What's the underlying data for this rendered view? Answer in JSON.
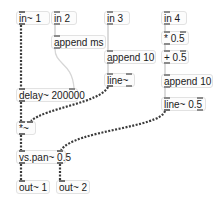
{
  "patcher": {
    "objects": [
      {
        "id": "in1",
        "text": "in~ 1"
      },
      {
        "id": "in2",
        "text": "in 2"
      },
      {
        "id": "in3",
        "text": "in 3"
      },
      {
        "id": "in4",
        "text": "in 4"
      },
      {
        "id": "append_ms",
        "text": "append ms"
      },
      {
        "id": "times_half",
        "text": "* 0.5"
      },
      {
        "id": "append10a",
        "text": "append 10"
      },
      {
        "id": "plus_half",
        "text": "+ 0.5"
      },
      {
        "id": "delay",
        "text": "delay~ 200000"
      },
      {
        "id": "line_a",
        "text": "line~"
      },
      {
        "id": "append10b",
        "text": "append 10"
      },
      {
        "id": "line_b",
        "text": "line~ 0.5"
      },
      {
        "id": "mult",
        "text": "*~"
      },
      {
        "id": "vspan",
        "text": "vs.pan~ 0.5"
      },
      {
        "id": "out1",
        "text": "out~ 1"
      },
      {
        "id": "out2",
        "text": "out~ 2"
      }
    ],
    "cords": [
      {
        "from": "in1",
        "to": "delay",
        "type": "signal"
      },
      {
        "from": "in2",
        "to": "append_ms",
        "type": "message"
      },
      {
        "from": "append_ms",
        "to": "delay",
        "type": "message"
      },
      {
        "from": "in3",
        "to": "append10a",
        "type": "message"
      },
      {
        "from": "append10a",
        "to": "line_a",
        "type": "message"
      },
      {
        "from": "in4",
        "to": "times_half",
        "type": "message"
      },
      {
        "from": "times_half",
        "to": "plus_half",
        "type": "message"
      },
      {
        "from": "plus_half",
        "to": "append10b",
        "type": "message"
      },
      {
        "from": "append10b",
        "to": "line_b",
        "type": "message"
      },
      {
        "from": "delay",
        "to": "mult",
        "type": "signal"
      },
      {
        "from": "line_a",
        "to": "mult",
        "type": "signal"
      },
      {
        "from": "mult",
        "to": "vspan",
        "type": "signal"
      },
      {
        "from": "line_b",
        "to": "vspan",
        "type": "signal"
      },
      {
        "from": "vspan",
        "to": "out1",
        "type": "signal"
      },
      {
        "from": "vspan",
        "to": "out2",
        "type": "signal"
      }
    ]
  }
}
